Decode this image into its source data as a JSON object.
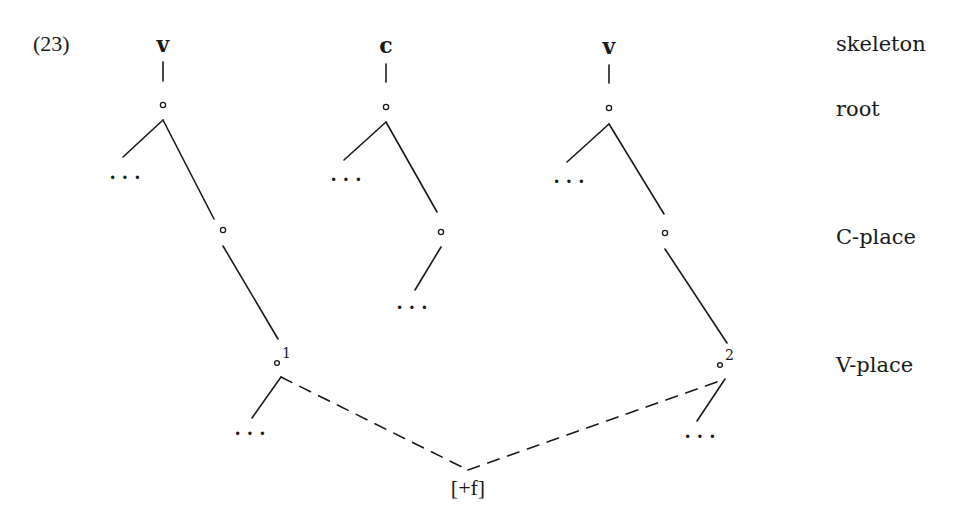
{
  "example": {
    "number": "(23)"
  },
  "skeleton_segments": [
    {
      "label": "v",
      "x": 163
    },
    {
      "label": "c",
      "x": 386
    },
    {
      "label": "v",
      "x": 609
    }
  ],
  "tier_labels": {
    "skeleton": "skeleton",
    "root": "root",
    "c_place": "C-place",
    "v_place": "V-place"
  },
  "node_symbol": "∘",
  "ellipsis": "...",
  "v_place_indices": {
    "first": "1",
    "second": "2"
  },
  "floating_feature": "[+f]",
  "colors": {
    "ink": "#1a1a1a",
    "background": "#ffffff"
  }
}
